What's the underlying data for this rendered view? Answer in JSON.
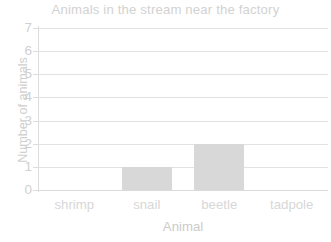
{
  "chart_data": {
    "type": "bar",
    "title": "Animals in the stream near the factory",
    "xlabel": "Animal",
    "ylabel": "Number of animals",
    "categories": [
      "shrimp",
      "snail",
      "beetle",
      "tadpole"
    ],
    "values": [
      0,
      1,
      2,
      0
    ],
    "ylim": [
      0,
      7
    ],
    "ytick_labels": [
      "0",
      "1",
      "2",
      "3",
      "4",
      "5",
      "6",
      "7"
    ],
    "ytick_values": [
      0,
      1,
      2,
      3,
      4,
      5,
      6,
      7
    ],
    "grid": true,
    "grid_axis": "y",
    "legend": false,
    "bar_color": "#d8d8d8",
    "grid_color": "#e2e2e2",
    "axis_color": "#dcdcdc",
    "text_color": "#d2d2d2",
    "background": "#ffffff"
  }
}
